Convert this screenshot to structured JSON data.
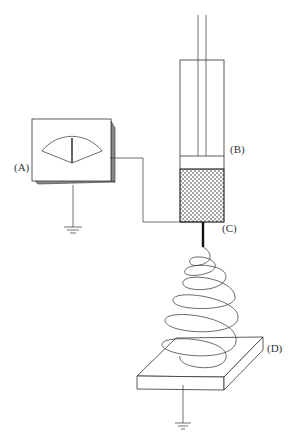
{
  "diagram": {
    "type": "electrospinning-apparatus",
    "labels": {
      "A": "(A)",
      "B": "(B)",
      "C": "(C)",
      "D": "(D)"
    },
    "components": [
      {
        "id": "A",
        "name": "voltmeter / high-voltage power supply"
      },
      {
        "id": "B",
        "name": "syringe with plunger and dotted solution"
      },
      {
        "id": "C",
        "name": "needle / spinneret"
      },
      {
        "id": "D",
        "name": "grounded collector plate"
      }
    ],
    "colors": {
      "line": "#333333",
      "shade": "#8a8a8a",
      "fill": "#ffffff"
    }
  }
}
